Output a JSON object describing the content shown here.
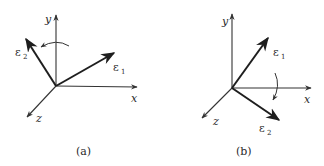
{
  "figure": {
    "panels": [
      {
        "id": "a",
        "caption": "(a)",
        "axes": {
          "x_label": "x",
          "y_label": "y",
          "z_label": "z"
        },
        "vectors": [
          {
            "symbol": "ε",
            "subscript": "2",
            "direction": "up-left"
          },
          {
            "symbol": "ε",
            "subscript": "1",
            "direction": "up-right"
          }
        ],
        "rotation": "counterclockwise arrow about y-axis"
      },
      {
        "id": "b",
        "caption": "(b)",
        "axes": {
          "x_label": "x",
          "y_label": "y",
          "z_label": "z"
        },
        "vectors": [
          {
            "symbol": "ε",
            "subscript": "1",
            "direction": "up-right"
          },
          {
            "symbol": "ε",
            "subscript": "2",
            "direction": "down-right"
          }
        ],
        "rotation": "arrow about x-axis"
      }
    ],
    "colors": {
      "ink": "#1e1e1e",
      "background": "#ffffff"
    }
  }
}
